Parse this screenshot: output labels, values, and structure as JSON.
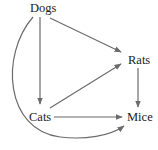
{
  "diagram": {
    "type": "directed-graph",
    "colors": {
      "edge": "#6b6b6b",
      "text": "#222222",
      "background": "#ffffff"
    },
    "nodes": [
      {
        "id": "dogs",
        "label": "Dogs"
      },
      {
        "id": "rats",
        "label": "Rats"
      },
      {
        "id": "cats",
        "label": "Cats"
      },
      {
        "id": "mice",
        "label": "Mice"
      }
    ],
    "edges": [
      {
        "from": "Dogs",
        "to": "Cats"
      },
      {
        "from": "Dogs",
        "to": "Rats"
      },
      {
        "from": "Dogs",
        "to": "Mice",
        "style": "curved"
      },
      {
        "from": "Cats",
        "to": "Rats"
      },
      {
        "from": "Cats",
        "to": "Mice"
      },
      {
        "from": "Rats",
        "to": "Mice"
      }
    ]
  }
}
